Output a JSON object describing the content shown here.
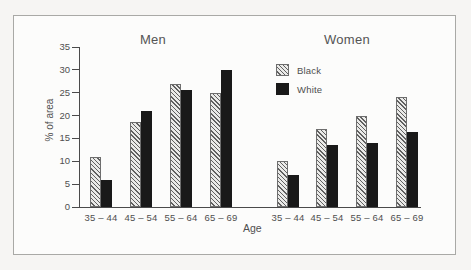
{
  "figure": {
    "frame_border_color": "#a9a9a6",
    "background_color": "#fcfcfb",
    "axis_color": "#4a4a4a",
    "text_color": "#4f4f4f",
    "hatch_bg_color": "#eaeae8",
    "hatch_line_color": "#606060",
    "solid_bar_color": "#191919"
  },
  "chart_data": {
    "type": "bar",
    "ylabel": "% of area",
    "xlabel": "Age",
    "ylim": [
      0,
      35
    ],
    "yticks": [
      0,
      5,
      10,
      15,
      20,
      25,
      30,
      35
    ],
    "grid": false,
    "legend_position": "top-center-right",
    "legend": [
      {
        "label": "Black",
        "style": "hatched"
      },
      {
        "label": "White",
        "style": "solid"
      }
    ],
    "categories": [
      "35 – 44",
      "45 – 54",
      "55 – 64",
      "65 – 69"
    ],
    "panels": [
      {
        "title": "Men",
        "series": [
          {
            "name": "Black",
            "style": "hatched",
            "values": [
              11,
              18.5,
              27,
              25
            ]
          },
          {
            "name": "White",
            "style": "solid",
            "values": [
              6,
              21,
              25.5,
              30
            ]
          }
        ]
      },
      {
        "title": "Women",
        "series": [
          {
            "name": "Black",
            "style": "hatched",
            "values": [
              10,
              17,
              20,
              24
            ]
          },
          {
            "name": "White",
            "style": "solid",
            "values": [
              7,
              13.5,
              14,
              16.5
            ]
          }
        ]
      }
    ]
  }
}
